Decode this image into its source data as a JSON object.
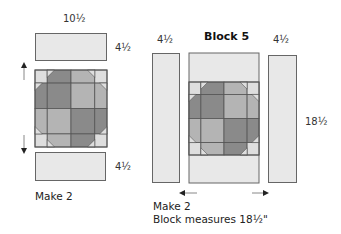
{
  "left_unit": {
    "top_width_label": "10½",
    "top_strip_height_label": "4½",
    "bottom_strip_height_label": "4½",
    "note": "Make 2"
  },
  "right_unit": {
    "title": "Block 5",
    "left_strip_width_label": "4½",
    "right_strip_width_label": "4½",
    "height_label": "18½",
    "note_line1": "Make 2",
    "note_line2": "Block measures 18½\""
  },
  "colors": {
    "background_fabric": "#e8e8e8",
    "dark_fabric": "#8a8a8a",
    "medium_fabric": "#b4b4b4",
    "corner_light": "#dedede",
    "outline": "#555555"
  }
}
